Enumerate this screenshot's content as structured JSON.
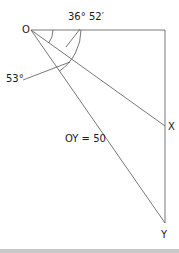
{
  "diagram": {
    "labels": {
      "origin": "O",
      "point_x": "X",
      "point_y": "Y",
      "angle_small": "36° 52′",
      "angle_large": "53°",
      "length_oy": "OY = 50"
    },
    "colors": {
      "line": "#555555",
      "text": "#1a1a1a",
      "bottom_bar": "#c8c8c8"
    }
  }
}
